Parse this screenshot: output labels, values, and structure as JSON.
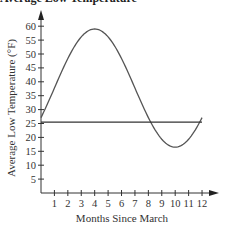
{
  "chart_data": {
    "type": "line",
    "title": "Average Low Temperature",
    "xlabel": "Months Since March",
    "ylabel": "Average Low Temperature (°F)",
    "xlim": [
      0,
      12.5
    ],
    "ylim": [
      0,
      62
    ],
    "x_ticks": [
      1,
      2,
      3,
      4,
      5,
      6,
      7,
      8,
      9,
      10,
      11,
      12
    ],
    "x_tick_labels": [
      "1",
      "2",
      "3",
      "4",
      "5",
      "6",
      "7",
      "8",
      "9",
      "10",
      "11",
      "12"
    ],
    "y_ticks": [
      5,
      10,
      15,
      20,
      25,
      30,
      35,
      40,
      45,
      50,
      55,
      60
    ],
    "y_tick_labels": [
      "5",
      "10",
      "15",
      "20",
      "25",
      "30",
      "35",
      "40",
      "45",
      "50",
      "55",
      "60"
    ],
    "grid": false,
    "legend": "none",
    "series": [
      {
        "name": "Average low temperature curve",
        "kind": "sinusoid",
        "midline": 37.75,
        "amplitude": 21.25,
        "period": 12,
        "peak_x": 4,
        "x_range": [
          0,
          12
        ],
        "x": [
          0,
          1,
          2,
          3,
          4,
          5,
          6,
          7,
          8,
          9,
          10,
          11,
          12
        ],
        "values": [
          27.1,
          37.75,
          48.4,
          56.2,
          59.0,
          56.2,
          48.4,
          37.75,
          27.1,
          19.3,
          16.5,
          19.3,
          27.1
        ]
      },
      {
        "name": "Horizontal reference line",
        "kind": "constant",
        "value": 25.5,
        "x_range": [
          0,
          12
        ]
      }
    ]
  }
}
